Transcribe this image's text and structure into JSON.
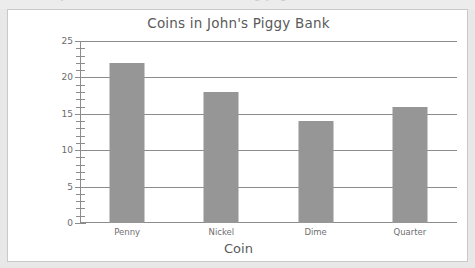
{
  "page": {
    "background_color": "#e8e8e8",
    "card_background": "#ffffff",
    "cut_off_text": "worksheet header text partially cropped"
  },
  "chart_data": {
    "type": "bar",
    "title": "Coins in John's Piggy Bank",
    "xlabel": "Coin",
    "ylabel": "Number of coins",
    "categories": [
      "Penny",
      "Nickel",
      "Dime",
      "Quarter"
    ],
    "values": [
      22,
      18,
      14,
      16
    ],
    "ylim": [
      0,
      25
    ],
    "ytick_labels": [
      "0",
      "5",
      "10",
      "15",
      "20",
      "25"
    ],
    "ytick_values": [
      0,
      5,
      10,
      15,
      20,
      25
    ],
    "minor_tick_step": 1,
    "grid": true,
    "grid_axis": "y",
    "legend": false,
    "bar_color": "#969696",
    "axis_color": "#8c8c8c",
    "text_color": "#5a5a5a"
  }
}
